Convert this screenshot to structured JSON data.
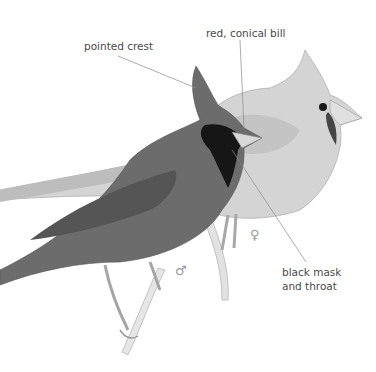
{
  "illustration": {
    "subject": "Northern cardinal pair (male in front, female behind) perched on a branch",
    "style": "grayscale pencil/paint illustration",
    "labels": [
      {
        "text": "pointed crest",
        "x": 84,
        "y": 40,
        "line": [
          [
            118,
            56
          ],
          [
            196,
            88
          ]
        ]
      },
      {
        "text": "red, conical bill",
        "x": 206,
        "y": 27,
        "line": [
          [
            240,
            40
          ],
          [
            244,
            128
          ]
        ]
      },
      {
        "text": "black mask",
        "x": 282,
        "y": 266
      },
      {
        "text": "and throat",
        "x": 282,
        "y": 280
      }
    ],
    "pointer_line_mask": [
      [
        232,
        150
      ],
      [
        306,
        262
      ]
    ],
    "sex_symbols": {
      "male": {
        "glyph": "♂",
        "x": 175,
        "y": 264
      },
      "female": {
        "glyph": "♀",
        "x": 250,
        "y": 228
      }
    },
    "colors": {
      "background": "#ffffff",
      "male_body": "#6e6e6e",
      "female_body": "#d6d6d6",
      "mask": "#151515",
      "label_text": "#4a4a4a",
      "leader_line": "#8a8a8a"
    }
  }
}
